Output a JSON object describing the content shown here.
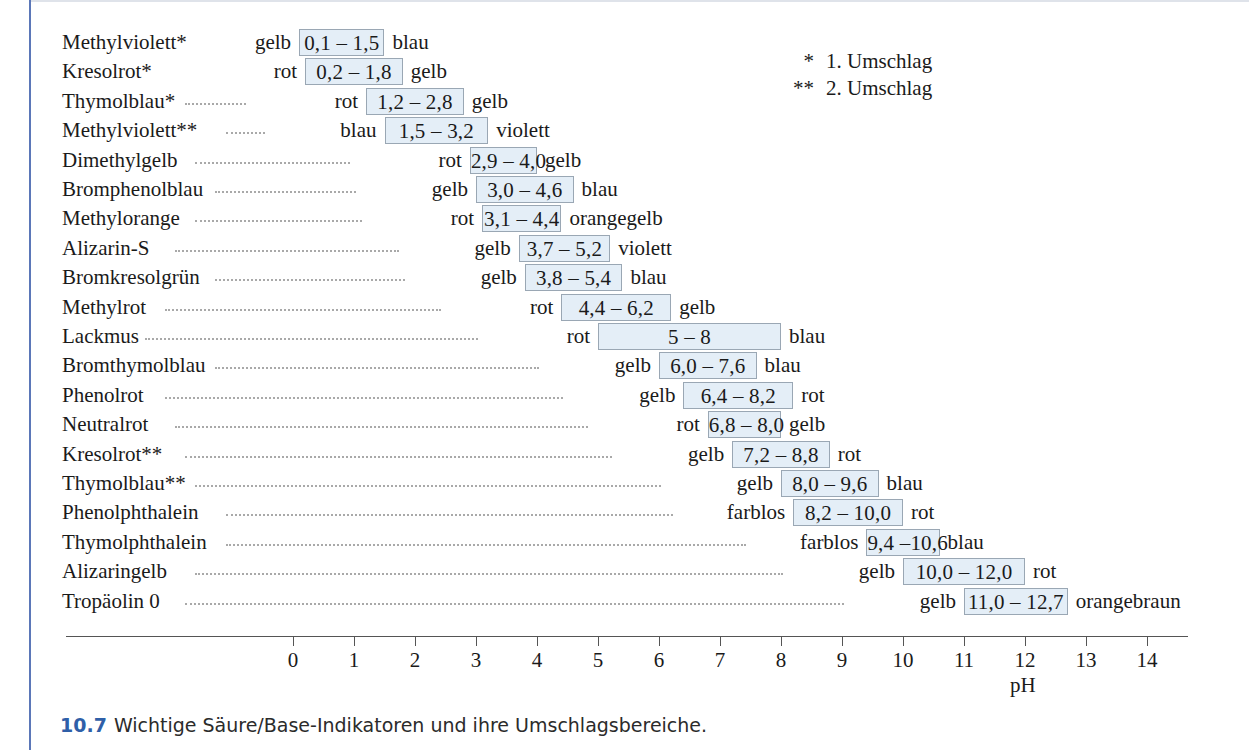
{
  "caption": {
    "number": "10.7",
    "text": "Wichtige Säure/Base-Indikatoren und ihre Umschlagsbereiche."
  },
  "legend": {
    "items": [
      {
        "marker": "*",
        "label": "1. Umschlag"
      },
      {
        "marker": "**",
        "label": "2. Umschlag"
      }
    ]
  },
  "axis": {
    "label": "pH",
    "ticks": [
      "0",
      "1",
      "2",
      "3",
      "4",
      "5",
      "6",
      "7",
      "8",
      "9",
      "10",
      "11",
      "12",
      "13",
      "14"
    ]
  },
  "colors": {
    "box_fill": "#e4eef7",
    "box_border": "#9aa7b4",
    "rule": "#5b77b8",
    "caption_number": "#2f5fa8",
    "axis": "#555555"
  },
  "chart_data": {
    "type": "bar",
    "title": "Wichtige Säure/Base-Indikatoren und ihre Umschlagsbereiche",
    "xlabel": "pH",
    "ylabel": "",
    "xlim": [
      0,
      14
    ],
    "grid": false,
    "orientation": "horizontal",
    "legend": [
      "* 1. Umschlag",
      "** 2. Umschlag"
    ],
    "categories": [
      "Methylviolett*",
      "Kresolrot*",
      "Thymolblau*",
      "Methylviolett**",
      "Dimethylgelb",
      "Bromphenolblau",
      "Methylorange",
      "Alizarin-S",
      "Bromkresolgrün",
      "Methylrot",
      "Lackmus",
      "Bromthymolblau",
      "Phenolrot",
      "Neutralrot",
      "Kresolrot**",
      "Thymolblau**",
      "Phenolphthalein",
      "Thymolphthalein",
      "Alizaringelb",
      "Tropäolin 0"
    ],
    "rows": [
      {
        "name": "Methylviolett*",
        "acid_color": "gelb",
        "range_text": "0,1 – 1,5",
        "low": 0.1,
        "high": 1.5,
        "base_color": "blau"
      },
      {
        "name": "Kresolrot*",
        "acid_color": "rot",
        "range_text": "0,2 – 1,8",
        "low": 0.2,
        "high": 1.8,
        "base_color": "gelb"
      },
      {
        "name": "Thymolblau*",
        "acid_color": "rot",
        "range_text": "1,2 – 2,8",
        "low": 1.2,
        "high": 2.8,
        "base_color": "gelb"
      },
      {
        "name": "Methylviolett**",
        "acid_color": "blau",
        "range_text": "1,5 – 3,2",
        "low": 1.5,
        "high": 3.2,
        "base_color": "violett"
      },
      {
        "name": "Dimethylgelb",
        "acid_color": "rot",
        "range_text": "2,9 – 4,0",
        "low": 2.9,
        "high": 4.0,
        "base_color": "gelb"
      },
      {
        "name": "Bromphenolblau",
        "acid_color": "gelb",
        "range_text": "3,0 – 4,6",
        "low": 3.0,
        "high": 4.6,
        "base_color": "blau"
      },
      {
        "name": "Methylorange",
        "acid_color": "rot",
        "range_text": "3,1 – 4,4",
        "low": 3.1,
        "high": 4.4,
        "base_color": "orangegelb"
      },
      {
        "name": "Alizarin-S",
        "acid_color": "gelb",
        "range_text": "3,7 – 5,2",
        "low": 3.7,
        "high": 5.2,
        "base_color": "violett"
      },
      {
        "name": "Bromkresolgrün",
        "acid_color": "gelb",
        "range_text": "3,8 – 5,4",
        "low": 3.8,
        "high": 5.4,
        "base_color": "blau"
      },
      {
        "name": "Methylrot",
        "acid_color": "rot",
        "range_text": "4,4 – 6,2",
        "low": 4.4,
        "high": 6.2,
        "base_color": "gelb"
      },
      {
        "name": "Lackmus",
        "acid_color": "rot",
        "range_text": "5 – 8",
        "low": 5.0,
        "high": 8.0,
        "base_color": "blau"
      },
      {
        "name": "Bromthymolblau",
        "acid_color": "gelb",
        "range_text": "6,0 – 7,6",
        "low": 6.0,
        "high": 7.6,
        "base_color": "blau"
      },
      {
        "name": "Phenolrot",
        "acid_color": "gelb",
        "range_text": "6,4 – 8,2",
        "low": 6.4,
        "high": 8.2,
        "base_color": "rot"
      },
      {
        "name": "Neutralrot",
        "acid_color": "rot",
        "range_text": "6,8 – 8,0",
        "low": 6.8,
        "high": 8.0,
        "base_color": "gelb"
      },
      {
        "name": "Kresolrot**",
        "acid_color": "gelb",
        "range_text": "7,2 – 8,8",
        "low": 7.2,
        "high": 8.8,
        "base_color": "rot"
      },
      {
        "name": "Thymolblau**",
        "acid_color": "gelb",
        "range_text": "8,0 – 9,6",
        "low": 8.0,
        "high": 9.6,
        "base_color": "blau"
      },
      {
        "name": "Phenolphthalein",
        "acid_color": "farblos",
        "range_text": "8,2 – 10,0",
        "low": 8.2,
        "high": 10.0,
        "base_color": "rot"
      },
      {
        "name": "Thymolphthalein",
        "acid_color": "farblos",
        "range_text": "9,4 –10,6",
        "low": 9.4,
        "high": 10.6,
        "base_color": "blau"
      },
      {
        "name": "Alizaringelb",
        "acid_color": "gelb",
        "range_text": "10,0 – 12,0",
        "low": 10.0,
        "high": 12.0,
        "base_color": "rot"
      },
      {
        "name": "Tropäolin 0",
        "acid_color": "gelb",
        "range_text": "11,0 – 12,7",
        "low": 11.0,
        "high": 12.7,
        "base_color": "orangebraun"
      }
    ]
  }
}
